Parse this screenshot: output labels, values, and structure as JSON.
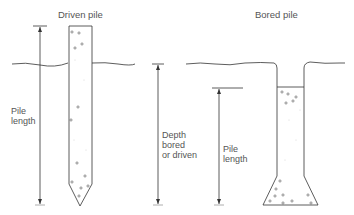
{
  "diagram": {
    "driven_pile": {
      "title": "Driven pile",
      "dimension_label_line1": "Pile",
      "dimension_label_line2": "length"
    },
    "depth": {
      "label_line1": "Depth",
      "label_line2": "bored",
      "label_line3": "or driven"
    },
    "bored_pile": {
      "title": "Bored pile",
      "dimension_label_line1": "Pile",
      "dimension_label_line2": "length"
    },
    "colors": {
      "line": "#333333",
      "text": "#555555",
      "fill_dots": "#999999"
    }
  }
}
